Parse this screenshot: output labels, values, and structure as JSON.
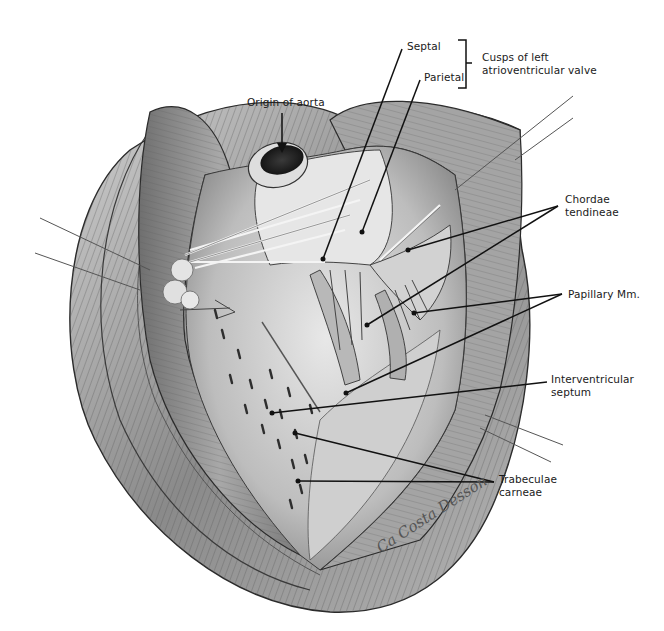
{
  "figure": {
    "style": "pencil anatomical illustration",
    "colors": {
      "background": "#ffffff",
      "ink": "#1a1a1a",
      "tissue_light": "#d9d9d9",
      "tissue_mid": "#9a9a9a",
      "tissue_dark": "#4a4a4a"
    }
  },
  "labels": {
    "septal": "Septal",
    "parietal": "Parietal",
    "cusps_line1": "Cusps of left",
    "cusps_line2": "atrioventricular valve",
    "origin_of_aorta": "Origin of aorta",
    "chordae_line1": "Chordae",
    "chordae_line2": "tendineae",
    "papillary": "Papillary Mm.",
    "interventricular_line1": "Interventricular",
    "interventricular_line2": "septum",
    "trabeculae_line1": "Trabeculae",
    "trabeculae_line2": "carneae"
  },
  "signature": "Ca Costa Desson"
}
